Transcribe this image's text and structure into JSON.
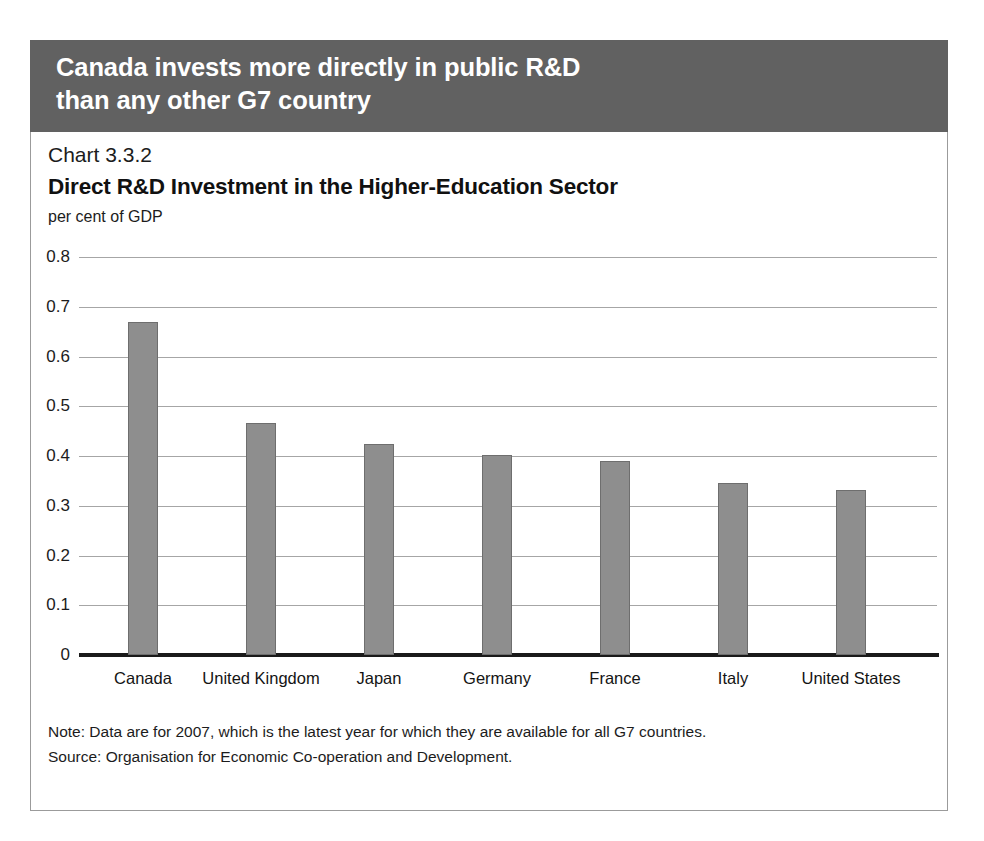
{
  "banner": {
    "line1": "Canada invests more directly in public R&D",
    "line2": "than any other G7 country",
    "background_color": "#616161",
    "text_color": "#ffffff"
  },
  "panel": {
    "chart_number": "Chart 3.3.2",
    "title": "Direct R&D Investment in the Higher-Education Sector",
    "units": "per cent of GDP",
    "note": "Note: Data are for 2007, which is the latest year for which they are available for all G7 countries.",
    "source": "Source: Organisation for Economic Co-operation and Development."
  },
  "chart_data": {
    "type": "bar",
    "title": "Direct R&D Investment in the Higher-Education Sector",
    "subtitle": "Chart 3.3.2",
    "xlabel": "",
    "ylabel": "per cent of GDP",
    "ylim": [
      0,
      0.8
    ],
    "yticks": [
      "0",
      "0.1",
      "0.2",
      "0.3",
      "0.4",
      "0.5",
      "0.6",
      "0.7",
      "0.8"
    ],
    "ytick_values": [
      0,
      0.1,
      0.2,
      0.3,
      0.4,
      0.5,
      0.6,
      0.7,
      0.8
    ],
    "grid": true,
    "legend": "none",
    "bar_color": "#8e8e8e",
    "bar_edge_color": "#6e6e6e",
    "categories": [
      "Canada",
      "United Kingdom",
      "Japan",
      "Germany",
      "France",
      "Italy",
      "United States"
    ],
    "values": [
      0.67,
      0.467,
      0.425,
      0.403,
      0.39,
      0.345,
      0.332
    ]
  }
}
